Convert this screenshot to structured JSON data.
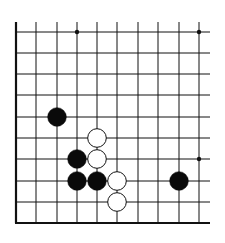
{
  "board": {
    "type": "go-diagram",
    "columns": 10,
    "rows": 10,
    "col_x": [
      16,
      36,
      57,
      77,
      97,
      117,
      138,
      158,
      179,
      199
    ],
    "row_y": [
      32,
      53,
      74,
      95,
      117,
      138,
      159,
      181,
      202,
      223
    ],
    "edges": {
      "left": true,
      "bottom": true,
      "top": false,
      "right": false
    },
    "line_color": "#111111",
    "background": "#ffffff",
    "star_points": [
      {
        "col": 3,
        "row": 0
      },
      {
        "col": 9,
        "row": 0
      },
      {
        "col": 9,
        "row": 6
      }
    ],
    "stones": [
      {
        "color": "black",
        "col": 2,
        "row": 4
      },
      {
        "color": "white",
        "col": 4,
        "row": 5
      },
      {
        "color": "black",
        "col": 3,
        "row": 6
      },
      {
        "color": "white",
        "col": 4,
        "row": 6
      },
      {
        "color": "black",
        "col": 3,
        "row": 7
      },
      {
        "color": "black",
        "col": 4,
        "row": 7
      },
      {
        "color": "white",
        "col": 5,
        "row": 7
      },
      {
        "color": "white",
        "col": 5,
        "row": 8
      },
      {
        "color": "black",
        "col": 8,
        "row": 7
      }
    ]
  }
}
